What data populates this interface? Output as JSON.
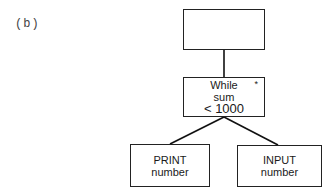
{
  "figure_label": "(b)",
  "nodes": {
    "top": {
      "lines": []
    },
    "while": {
      "lines": [
        "While",
        "sum",
        "< 1000"
      ],
      "marker": "*"
    },
    "print": {
      "lines": [
        "PRINT",
        "number"
      ]
    },
    "input": {
      "lines": [
        "INPUT",
        "number"
      ]
    }
  },
  "edges": [
    {
      "from": "top",
      "to": "while"
    },
    {
      "from": "while",
      "to": "print"
    },
    {
      "from": "while",
      "to": "input"
    }
  ]
}
